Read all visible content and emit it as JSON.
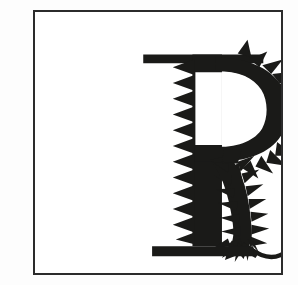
{
  "artwork": {
    "title": "Decorative Letter R",
    "subject_letter": "R",
    "description": "Black silhouette of a serif capital letter R whose contours are rendered as a spiky, bristled caterpillar-like creature",
    "medium": "black and white line illustration",
    "alt_text": "A framed black-and-white illustration of the capital letter R drawn as a spiky caterpillar with a curling tail"
  },
  "frame": {
    "name": "rectangular-border",
    "stroke_color": "#2b2b2b",
    "stroke_width_px": 2,
    "fill_color": "#ffffff",
    "x": 33,
    "y": 10,
    "width": 250,
    "height": 265
  },
  "canvas": {
    "width": 298,
    "height": 285,
    "background_color": "#fdfdfd",
    "ink_color": "#1a1a18"
  },
  "letterform": {
    "glyph": "R",
    "style": "serif",
    "parts": [
      {
        "name": "top-serif-bar",
        "label": "Top horizontal serif",
        "texture": "smooth"
      },
      {
        "name": "vertical-stem",
        "label": "Vertical stem",
        "texture": "sawtooth",
        "teeth_count": 19,
        "teeth_side": "left"
      },
      {
        "name": "bowl",
        "label": "Upper bowl",
        "texture": "radiating-spikes",
        "spike_count": 16,
        "spike_side": "outer-right"
      },
      {
        "name": "counter",
        "label": "Bowl counter (white opening)",
        "texture": "smooth",
        "fill": "#ffffff"
      },
      {
        "name": "leg",
        "label": "Diagonal leg",
        "texture": "bristled-segments",
        "segment_count": 9
      },
      {
        "name": "tail",
        "label": "Curling tail tip",
        "texture": "thin-curve"
      },
      {
        "name": "bottom-serif-bar",
        "label": "Bottom horizontal serif",
        "texture": "smooth"
      }
    ]
  }
}
